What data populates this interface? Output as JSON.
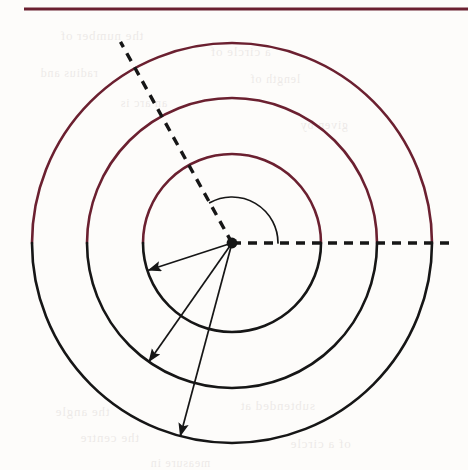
{
  "page": {
    "width": 468,
    "height": 470,
    "background_color": "#fdfcfa",
    "rule_color": "#6b2030",
    "ink_color": "#161616",
    "arc_color": "#6b2030"
  },
  "header_rule": {
    "label": "horizontal-rule",
    "x_start": 24,
    "x_end": 468,
    "y": 9,
    "thickness": 3
  },
  "figure": {
    "center": {
      "x": 232,
      "y": 243,
      "label": "center-point"
    },
    "circles": [
      {
        "name": "c1",
        "label": "c₁",
        "radius_px": 89,
        "radius_cm": 4,
        "label_x": 279,
        "label_y": 151
      },
      {
        "name": "c2",
        "label": "c₂",
        "radius_px": 145,
        "radius_cm": 6,
        "label_x": 310,
        "label_y": 101
      },
      {
        "name": "c3",
        "label": "c₃",
        "radius_px": 200,
        "radius_cm": 8,
        "label_x": 338,
        "label_y": 51
      }
    ],
    "angle": {
      "symbol": "θ",
      "label_x": 255,
      "label_y": 203,
      "arc_radius_px": 46,
      "from_deg": 0,
      "to_deg": 119
    },
    "rays": [
      {
        "name": "horizontal-dashed-ray",
        "style": "dashed",
        "angle_deg": 0,
        "length_px": 222
      },
      {
        "name": "terminal-dashed-ray",
        "style": "dashed",
        "angle_deg": 119,
        "length_px": 230
      }
    ],
    "radius_arrows": [
      {
        "name": "radius-arrow-4cm",
        "label": "4 cm",
        "angle_deg": 198,
        "length_px": 88,
        "label_x": 172,
        "label_y": 246,
        "label_rotation_deg": -18
      },
      {
        "name": "radius-arrow-6cm",
        "label": "6 cm",
        "angle_deg": 235,
        "length_px": 145,
        "label_x": 160,
        "label_y": 308,
        "label_rotation_deg": -56
      },
      {
        "name": "radius-arrow-8cm",
        "label": "8 cm",
        "angle_deg": 255,
        "length_px": 200,
        "label_x": 213,
        "label_y": 361,
        "label_rotation_deg": -74
      }
    ]
  },
  "bleed_through": {
    "note": "faint reversed text showing through from the back of the page",
    "lines": [
      {
        "text": "the number of",
        "x": 60,
        "y": 28,
        "size": 13
      },
      {
        "text": "a circle of",
        "x": 210,
        "y": 44,
        "size": 13
      },
      {
        "text": "radius and",
        "x": 40,
        "y": 66,
        "size": 12
      },
      {
        "text": "length of",
        "x": 250,
        "y": 72,
        "size": 12
      },
      {
        "text": "an arc is",
        "x": 120,
        "y": 96,
        "size": 12
      },
      {
        "text": "given by",
        "x": 300,
        "y": 118,
        "size": 12
      },
      {
        "text": "the angle",
        "x": 55,
        "y": 404,
        "size": 13
      },
      {
        "text": "subtended at",
        "x": 240,
        "y": 398,
        "size": 13
      },
      {
        "text": "the centre",
        "x": 80,
        "y": 430,
        "size": 13
      },
      {
        "text": "of a circle",
        "x": 290,
        "y": 436,
        "size": 13
      },
      {
        "text": "measure in",
        "x": 150,
        "y": 456,
        "size": 12
      }
    ]
  }
}
